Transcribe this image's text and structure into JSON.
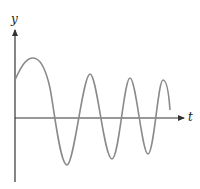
{
  "diagram": {
    "type": "damped-oscillation-sketch",
    "axes": {
      "y_label": "y",
      "x_label": "t"
    },
    "colors": {
      "axis": "#333333",
      "curve": "#8a8a8a",
      "background": "#ffffff"
    },
    "curve_points": [
      [
        15,
        80
      ],
      [
        33,
        58
      ],
      [
        48,
        85
      ],
      [
        58,
        118
      ],
      [
        67,
        165
      ],
      [
        80,
        118
      ],
      [
        90,
        74
      ],
      [
        100,
        118
      ],
      [
        112,
        159
      ],
      [
        121,
        118
      ],
      [
        130,
        78
      ],
      [
        140,
        118
      ],
      [
        148,
        154
      ],
      [
        156,
        118
      ],
      [
        163,
        80
      ],
      [
        170,
        110
      ]
    ]
  }
}
